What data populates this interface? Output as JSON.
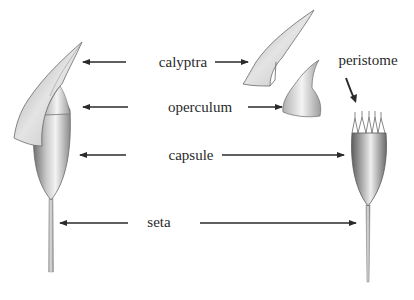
{
  "diagram": {
    "type": "labeled illustration",
    "figures": [
      {
        "name": "left-sporophyte",
        "description": "intact sporophyte with calyptra covering capsule"
      },
      {
        "name": "detached-calyptra"
      },
      {
        "name": "detached-operculum"
      },
      {
        "name": "right-sporophyte",
        "description": "open capsule showing peristome teeth"
      }
    ],
    "labels": {
      "calyptra": "calyptra",
      "operculum": "operculum",
      "capsule": "capsule",
      "seta": "seta",
      "peristome": "peristome"
    },
    "colors": {
      "ink": "#2a2a2a",
      "shade": "#7a7a7a",
      "background": "#ffffff"
    }
  }
}
